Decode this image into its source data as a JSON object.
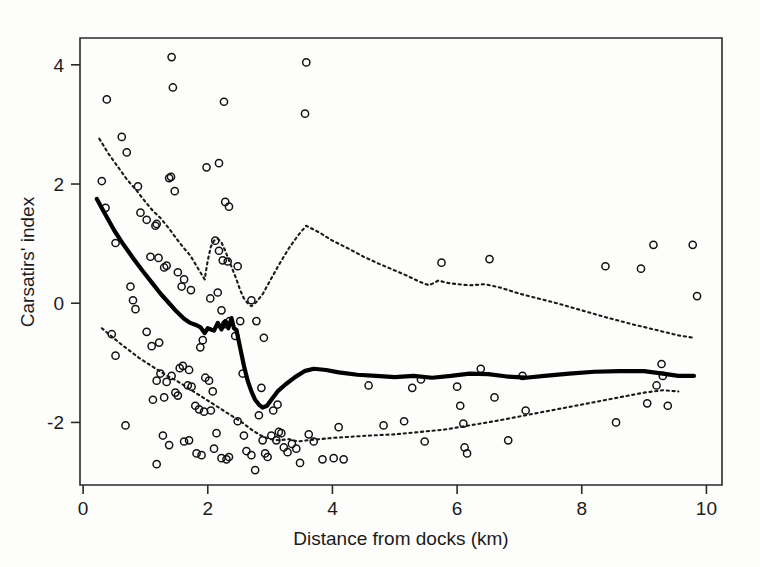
{
  "figure": {
    "width": 760,
    "height": 567,
    "background": "#fdfdfc"
  },
  "chart_data": {
    "type": "scatter",
    "title": "",
    "xlabel": "Distance from docks (km)",
    "ylabel": "Carsatirs' index",
    "xlim": [
      -0.05,
      10.25
    ],
    "ylim": [
      -3.05,
      4.45
    ],
    "xticks": [
      0,
      2,
      4,
      6,
      8,
      10
    ],
    "xtick_labels": [
      "0",
      "2",
      "4",
      "6",
      "8",
      "10"
    ],
    "yticks": [
      -2,
      0,
      2,
      4
    ],
    "ytick_labels": [
      "-2",
      "0",
      "2",
      "4"
    ],
    "grid": false,
    "legend": "none",
    "marker": "open-circle",
    "marker_color": "#111111",
    "line_color": "#000000",
    "band_color": "#1a1a1a",
    "points": [
      [
        0.38,
        3.42
      ],
      [
        0.3,
        2.05
      ],
      [
        0.62,
        2.79
      ],
      [
        0.7,
        2.53
      ],
      [
        0.36,
        1.6
      ],
      [
        0.52,
        1.01
      ],
      [
        0.88,
        1.96
      ],
      [
        1.02,
        1.4
      ],
      [
        0.92,
        1.52
      ],
      [
        1.18,
        1.33
      ],
      [
        1.16,
        1.3
      ],
      [
        1.42,
        4.13
      ],
      [
        1.44,
        3.62
      ],
      [
        1.38,
        2.1
      ],
      [
        1.41,
        2.12
      ],
      [
        1.47,
        1.88
      ],
      [
        1.08,
        0.78
      ],
      [
        1.21,
        0.76
      ],
      [
        1.34,
        0.63
      ],
      [
        1.3,
        0.6
      ],
      [
        1.52,
        0.52
      ],
      [
        1.62,
        0.4
      ],
      [
        1.58,
        0.28
      ],
      [
        1.73,
        0.22
      ],
      [
        0.76,
        0.28
      ],
      [
        0.8,
        0.05
      ],
      [
        0.84,
        -0.1
      ],
      [
        0.46,
        -0.52
      ],
      [
        0.52,
        -0.88
      ],
      [
        0.68,
        -2.05
      ],
      [
        1.02,
        -0.48
      ],
      [
        1.1,
        -0.72
      ],
      [
        1.22,
        -0.66
      ],
      [
        1.18,
        -1.3
      ],
      [
        1.34,
        -1.32
      ],
      [
        1.24,
        -1.18
      ],
      [
        1.42,
        -1.22
      ],
      [
        1.3,
        -1.58
      ],
      [
        1.12,
        -1.62
      ],
      [
        1.48,
        -1.5
      ],
      [
        1.52,
        -1.55
      ],
      [
        1.28,
        -2.22
      ],
      [
        1.38,
        -2.38
      ],
      [
        1.18,
        -2.7
      ],
      [
        1.6,
        -1.05
      ],
      [
        1.7,
        -1.12
      ],
      [
        1.55,
        -1.09
      ],
      [
        1.68,
        -1.38
      ],
      [
        1.74,
        -1.4
      ],
      [
        1.8,
        -1.72
      ],
      [
        1.62,
        -2.32
      ],
      [
        1.7,
        -2.3
      ],
      [
        1.88,
        -0.74
      ],
      [
        1.92,
        -0.62
      ],
      [
        1.96,
        -1.25
      ],
      [
        2.02,
        -1.3
      ],
      [
        2.08,
        -1.48
      ],
      [
        1.86,
        -1.78
      ],
      [
        1.94,
        -1.82
      ],
      [
        2.05,
        -1.8
      ],
      [
        1.82,
        -2.52
      ],
      [
        1.9,
        -2.55
      ],
      [
        2.14,
        -2.18
      ],
      [
        2.1,
        -2.44
      ],
      [
        2.22,
        -2.6
      ],
      [
        2.3,
        -2.62
      ],
      [
        2.34,
        -2.58
      ],
      [
        2.04,
        0.08
      ],
      [
        2.16,
        0.18
      ],
      [
        2.22,
        -0.12
      ],
      [
        2.28,
        -0.35
      ],
      [
        2.35,
        -0.3
      ],
      [
        2.12,
        1.05
      ],
      [
        2.18,
        0.88
      ],
      [
        2.24,
        0.72
      ],
      [
        2.32,
        0.7
      ],
      [
        1.98,
        2.28
      ],
      [
        2.18,
        2.35
      ],
      [
        2.28,
        1.7
      ],
      [
        2.34,
        1.62
      ],
      [
        2.26,
        3.38
      ],
      [
        2.48,
        0.62
      ],
      [
        2.52,
        -0.3
      ],
      [
        2.44,
        -0.55
      ],
      [
        2.56,
        -1.18
      ],
      [
        2.48,
        -1.98
      ],
      [
        2.58,
        -2.22
      ],
      [
        2.62,
        -2.48
      ],
      [
        2.7,
        -2.55
      ],
      [
        2.76,
        -2.8
      ],
      [
        2.88,
        -2.3
      ],
      [
        2.92,
        -2.52
      ],
      [
        2.96,
        -2.58
      ],
      [
        2.82,
        -1.88
      ],
      [
        2.86,
        -1.42
      ],
      [
        2.7,
        0.05
      ],
      [
        2.78,
        -0.3
      ],
      [
        2.9,
        -0.58
      ],
      [
        3.02,
        -2.22
      ],
      [
        3.1,
        -2.3
      ],
      [
        3.14,
        -2.16
      ],
      [
        3.18,
        -2.18
      ],
      [
        3.22,
        -2.42
      ],
      [
        3.28,
        -2.5
      ],
      [
        3.05,
        -1.8
      ],
      [
        3.12,
        -1.7
      ],
      [
        3.35,
        -2.36
      ],
      [
        3.42,
        -2.44
      ],
      [
        3.48,
        -2.68
      ],
      [
        3.58,
        4.04
      ],
      [
        3.56,
        3.18
      ],
      [
        3.62,
        -2.2
      ],
      [
        3.7,
        -2.32
      ],
      [
        3.84,
        -2.62
      ],
      [
        4.02,
        -2.6
      ],
      [
        4.1,
        -2.08
      ],
      [
        4.18,
        -2.62
      ],
      [
        4.58,
        -1.38
      ],
      [
        4.82,
        -2.05
      ],
      [
        5.15,
        -1.98
      ],
      [
        5.28,
        -1.42
      ],
      [
        5.42,
        -1.28
      ],
      [
        5.48,
        -2.32
      ],
      [
        5.75,
        0.68
      ],
      [
        6.0,
        -1.4
      ],
      [
        6.05,
        -1.72
      ],
      [
        6.1,
        -2.02
      ],
      [
        6.12,
        -2.42
      ],
      [
        6.16,
        -2.52
      ],
      [
        6.38,
        -1.1
      ],
      [
        6.52,
        0.74
      ],
      [
        6.6,
        -1.58
      ],
      [
        6.82,
        -2.3
      ],
      [
        7.05,
        -1.22
      ],
      [
        7.1,
        -1.8
      ],
      [
        8.38,
        0.62
      ],
      [
        8.55,
        -2.0
      ],
      [
        8.95,
        0.58
      ],
      [
        9.15,
        0.98
      ],
      [
        9.28,
        -1.02
      ],
      [
        9.3,
        -1.22
      ],
      [
        9.2,
        -1.38
      ],
      [
        9.38,
        -1.72
      ],
      [
        9.05,
        -1.68
      ],
      [
        9.78,
        0.98
      ],
      [
        9.85,
        0.12
      ]
    ],
    "series": [
      {
        "name": "fitted-curve",
        "style": "solid",
        "points": [
          [
            0.22,
            1.75
          ],
          [
            0.35,
            1.5
          ],
          [
            0.5,
            1.22
          ],
          [
            0.65,
            0.98
          ],
          [
            0.8,
            0.76
          ],
          [
            0.95,
            0.55
          ],
          [
            1.1,
            0.35
          ],
          [
            1.25,
            0.15
          ],
          [
            1.38,
            0.0
          ],
          [
            1.5,
            -0.14
          ],
          [
            1.62,
            -0.26
          ],
          [
            1.72,
            -0.33
          ],
          [
            1.8,
            -0.36
          ],
          [
            1.88,
            -0.4
          ],
          [
            1.95,
            -0.5
          ],
          [
            2.0,
            -0.42
          ],
          [
            2.05,
            -0.44
          ],
          [
            2.1,
            -0.46
          ],
          [
            2.16,
            -0.33
          ],
          [
            2.22,
            -0.44
          ],
          [
            2.28,
            -0.3
          ],
          [
            2.33,
            -0.42
          ],
          [
            2.38,
            -0.25
          ],
          [
            2.42,
            -0.42
          ],
          [
            2.46,
            -0.45
          ],
          [
            2.52,
            -0.75
          ],
          [
            2.58,
            -1.05
          ],
          [
            2.64,
            -1.3
          ],
          [
            2.7,
            -1.48
          ],
          [
            2.76,
            -1.62
          ],
          [
            2.82,
            -1.7
          ],
          [
            2.88,
            -1.75
          ],
          [
            2.95,
            -1.72
          ],
          [
            3.02,
            -1.62
          ],
          [
            3.12,
            -1.48
          ],
          [
            3.25,
            -1.36
          ],
          [
            3.4,
            -1.24
          ],
          [
            3.55,
            -1.14
          ],
          [
            3.7,
            -1.1
          ],
          [
            3.9,
            -1.12
          ],
          [
            4.1,
            -1.16
          ],
          [
            4.4,
            -1.2
          ],
          [
            4.7,
            -1.22
          ],
          [
            5.0,
            -1.24
          ],
          [
            5.3,
            -1.22
          ],
          [
            5.6,
            -1.25
          ],
          [
            5.9,
            -1.22
          ],
          [
            6.2,
            -1.18
          ],
          [
            6.5,
            -1.19
          ],
          [
            6.8,
            -1.23
          ],
          [
            7.1,
            -1.25
          ],
          [
            7.4,
            -1.22
          ],
          [
            7.8,
            -1.18
          ],
          [
            8.2,
            -1.15
          ],
          [
            8.6,
            -1.14
          ],
          [
            9.0,
            -1.14
          ],
          [
            9.3,
            -1.18
          ],
          [
            9.55,
            -1.22
          ],
          [
            9.8,
            -1.22
          ]
        ]
      },
      {
        "name": "upper-confidence-band",
        "style": "dotted",
        "points": [
          [
            0.26,
            2.76
          ],
          [
            0.4,
            2.52
          ],
          [
            0.55,
            2.3
          ],
          [
            0.7,
            2.08
          ],
          [
            0.85,
            1.9
          ],
          [
            1.0,
            1.7
          ],
          [
            1.12,
            1.55
          ],
          [
            1.25,
            1.42
          ],
          [
            1.38,
            1.25
          ],
          [
            1.5,
            1.08
          ],
          [
            1.62,
            0.92
          ],
          [
            1.72,
            0.8
          ],
          [
            1.8,
            0.66
          ],
          [
            1.88,
            0.52
          ],
          [
            1.95,
            0.4
          ],
          [
            2.0,
            0.72
          ],
          [
            2.05,
            0.95
          ],
          [
            2.1,
            1.05
          ],
          [
            2.16,
            1.08
          ],
          [
            2.22,
            1.02
          ],
          [
            2.28,
            0.88
          ],
          [
            2.34,
            0.72
          ],
          [
            2.4,
            0.56
          ],
          [
            2.46,
            0.4
          ],
          [
            2.52,
            0.22
          ],
          [
            2.58,
            0.08
          ],
          [
            2.64,
            0.0
          ],
          [
            2.7,
            -0.05
          ],
          [
            2.78,
            0.02
          ],
          [
            2.88,
            0.15
          ],
          [
            3.0,
            0.38
          ],
          [
            3.15,
            0.66
          ],
          [
            3.3,
            0.92
          ],
          [
            3.45,
            1.14
          ],
          [
            3.58,
            1.3
          ],
          [
            3.8,
            1.18
          ],
          [
            4.0,
            1.05
          ],
          [
            4.25,
            0.92
          ],
          [
            4.5,
            0.78
          ],
          [
            4.75,
            0.66
          ],
          [
            5.0,
            0.55
          ],
          [
            5.2,
            0.46
          ],
          [
            5.4,
            0.36
          ],
          [
            5.55,
            0.3
          ],
          [
            5.7,
            0.38
          ],
          [
            5.85,
            0.34
          ],
          [
            6.0,
            0.32
          ],
          [
            6.2,
            0.3
          ],
          [
            6.45,
            0.32
          ],
          [
            6.7,
            0.26
          ],
          [
            7.0,
            0.16
          ],
          [
            7.3,
            0.08
          ],
          [
            7.6,
            0.0
          ],
          [
            8.0,
            -0.12
          ],
          [
            8.4,
            -0.24
          ],
          [
            8.8,
            -0.35
          ],
          [
            9.2,
            -0.45
          ],
          [
            9.55,
            -0.54
          ],
          [
            9.8,
            -0.58
          ]
        ]
      },
      {
        "name": "lower-confidence-band",
        "style": "dotted",
        "points": [
          [
            0.3,
            -0.42
          ],
          [
            0.45,
            -0.55
          ],
          [
            0.6,
            -0.68
          ],
          [
            0.75,
            -0.8
          ],
          [
            0.9,
            -0.92
          ],
          [
            1.05,
            -1.02
          ],
          [
            1.2,
            -1.12
          ],
          [
            1.35,
            -1.22
          ],
          [
            1.5,
            -1.3
          ],
          [
            1.65,
            -1.4
          ],
          [
            1.8,
            -1.5
          ],
          [
            1.95,
            -1.6
          ],
          [
            2.1,
            -1.7
          ],
          [
            2.25,
            -1.8
          ],
          [
            2.4,
            -1.9
          ],
          [
            2.55,
            -2.0
          ],
          [
            2.7,
            -2.12
          ],
          [
            2.85,
            -2.22
          ],
          [
            3.0,
            -2.28
          ],
          [
            3.15,
            -2.3
          ],
          [
            3.3,
            -2.28
          ],
          [
            3.45,
            -2.32
          ],
          [
            3.6,
            -2.3
          ],
          [
            3.8,
            -2.28
          ],
          [
            4.0,
            -2.26
          ],
          [
            4.3,
            -2.24
          ],
          [
            4.6,
            -2.22
          ],
          [
            5.0,
            -2.2
          ],
          [
            5.4,
            -2.16
          ],
          [
            5.8,
            -2.12
          ],
          [
            6.2,
            -2.05
          ],
          [
            6.6,
            -1.98
          ],
          [
            7.0,
            -1.9
          ],
          [
            7.4,
            -1.82
          ],
          [
            7.8,
            -1.74
          ],
          [
            8.2,
            -1.66
          ],
          [
            8.6,
            -1.58
          ],
          [
            9.0,
            -1.5
          ],
          [
            9.3,
            -1.46
          ],
          [
            9.55,
            -1.48
          ]
        ]
      }
    ]
  }
}
